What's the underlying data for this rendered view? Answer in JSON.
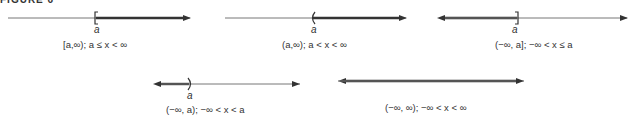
{
  "figure": {
    "title": "FIGURE 6"
  },
  "colors": {
    "axis": "#666666",
    "ray": "#333333"
  },
  "panels": [
    {
      "id": "closed-left-ray",
      "endpoint_label": "a",
      "bracket": "[",
      "shading": "right",
      "caption": "[a,∞);   a ≤ x < ∞"
    },
    {
      "id": "open-left-ray",
      "endpoint_label": "a",
      "bracket": "(",
      "shading": "right",
      "caption": "(a,∞);   a < x < ∞"
    },
    {
      "id": "closed-right-ray",
      "endpoint_label": "a",
      "bracket": "]",
      "shading": "left",
      "caption": "(−∞, a];   −∞ < x ≤ a"
    },
    {
      "id": "open-right-ray",
      "endpoint_label": "a",
      "bracket": ")",
      "shading": "left",
      "caption": "(−∞, a);   −∞ < x < a"
    },
    {
      "id": "whole-line",
      "endpoint_label": "",
      "bracket": "",
      "shading": "both",
      "caption": "(−∞, ∞);   −∞ < x < ∞"
    }
  ]
}
